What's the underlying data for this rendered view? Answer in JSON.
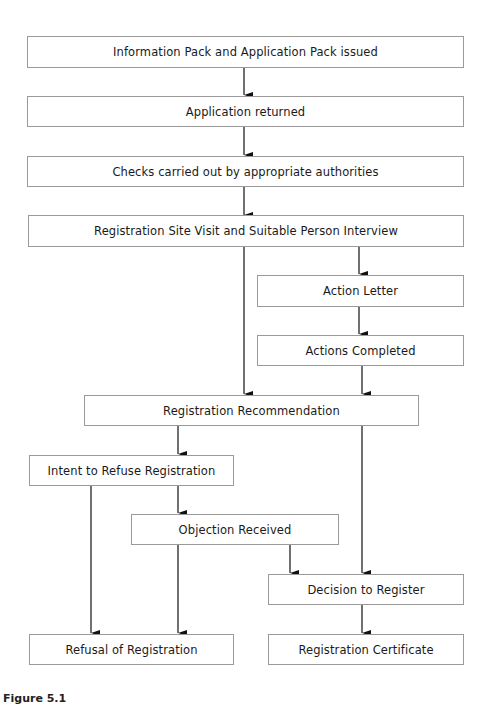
{
  "diagram": {
    "type": "flowchart",
    "nodes": {
      "info_pack": "Information Pack and Application Pack issued",
      "app_returned": "Application returned",
      "checks": "Checks carried out by appropriate authorities",
      "site_visit": "Registration Site Visit and Suitable Person Interview",
      "action_letter": "Action Letter",
      "actions_completed": "Actions Completed",
      "recommendation": "Registration Recommendation",
      "intent_refuse": "Intent to Refuse Registration",
      "objection": "Objection Received",
      "decision_register": "Decision to Register",
      "refusal": "Refusal of Registration",
      "certificate": "Registration Certificate"
    },
    "edges": [
      [
        "info_pack",
        "app_returned"
      ],
      [
        "app_returned",
        "checks"
      ],
      [
        "checks",
        "site_visit"
      ],
      [
        "site_visit",
        "recommendation"
      ],
      [
        "site_visit",
        "action_letter"
      ],
      [
        "action_letter",
        "actions_completed"
      ],
      [
        "actions_completed",
        "recommendation"
      ],
      [
        "recommendation",
        "intent_refuse"
      ],
      [
        "recommendation",
        "decision_register"
      ],
      [
        "intent_refuse",
        "refusal"
      ],
      [
        "intent_refuse",
        "objection"
      ],
      [
        "objection",
        "refusal"
      ],
      [
        "objection",
        "decision_register"
      ],
      [
        "decision_register",
        "certificate"
      ]
    ],
    "caption": "Figure 5.1"
  }
}
